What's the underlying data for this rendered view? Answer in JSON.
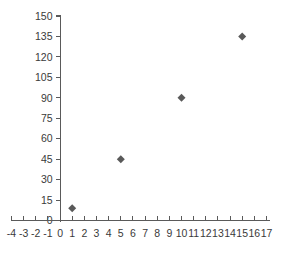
{
  "chart_data": {
    "type": "scatter",
    "title": "",
    "subtitle": "",
    "xlabel": "",
    "ylabel": "",
    "x": [
      1,
      5,
      10,
      15
    ],
    "values": [
      9,
      45,
      90,
      135
    ],
    "points": [
      {
        "x": 1,
        "y": 9
      },
      {
        "x": 5,
        "y": 45
      },
      {
        "x": 10,
        "y": 90
      },
      {
        "x": 15,
        "y": 135
      }
    ],
    "series": [
      {
        "name": "",
        "x": [
          1,
          5,
          10,
          15
        ],
        "values": [
          9,
          45,
          90,
          135
        ]
      }
    ],
    "xlim": [
      -4,
      17
    ],
    "ylim": [
      0,
      150
    ],
    "x_ticks": [
      -4,
      -3,
      -2,
      -1,
      0,
      1,
      2,
      3,
      4,
      5,
      6,
      7,
      8,
      9,
      10,
      11,
      12,
      13,
      14,
      15,
      16,
      17
    ],
    "y_ticks": [
      0,
      15,
      30,
      45,
      60,
      75,
      90,
      105,
      120,
      135,
      150
    ],
    "x_tick_labels": [
      "-4",
      "-3",
      "-2",
      "-1",
      "0",
      "1",
      "2",
      "3",
      "4",
      "5",
      "6",
      "7",
      "8",
      "9",
      "10",
      "11",
      "12",
      "13",
      "14",
      "15",
      "16",
      "17"
    ],
    "y_tick_labels": [
      "0",
      "15",
      "30",
      "45",
      "60",
      "75",
      "90",
      "105",
      "120",
      "135",
      "150"
    ],
    "x_tick_step": 1,
    "y_tick_step": 15,
    "grid": false,
    "legend": false,
    "legend_position": "none",
    "marker": "diamond",
    "marker_color": "#595959",
    "axis_color": "#5a5a5a",
    "tick_label_color": "#3a3a3a",
    "background_color": "#ffffff",
    "annotations": []
  }
}
